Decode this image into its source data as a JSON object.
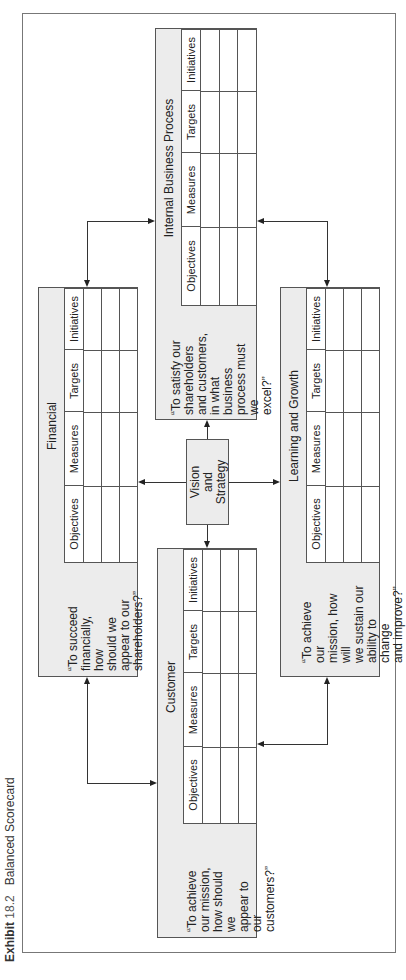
{
  "title": {
    "exhibit": "Exhibit",
    "number": "18.2",
    "caption": "Balanced Scorecard"
  },
  "table_columns": [
    "Objectives",
    "Measures",
    "Targets",
    "Initiatives"
  ],
  "center": {
    "label": "Vision and\nStrategy"
  },
  "perspectives": {
    "financial": {
      "title": "Financial",
      "question": "“To succeed\nfinancially, how\nshould we\nappear to our\nshareholders?”"
    },
    "customer": {
      "title": "Customer",
      "question": "“To achieve\nour mission,\nhow should we\nappear to our\ncustomers?”"
    },
    "internal": {
      "title": "Internal Business Process",
      "question": "“To satisfy our\nshareholders\nand customers,\nin what business\nprocess must we\nexcel?”"
    },
    "learning": {
      "title": "Learning and Growth",
      "question": "“To achieve our\nmission, how will\nwe sustain our\nability to change\nand improve?”"
    }
  },
  "colors": {
    "box_fill": "#ececec",
    "border": "#555555",
    "frame": "#777777"
  }
}
